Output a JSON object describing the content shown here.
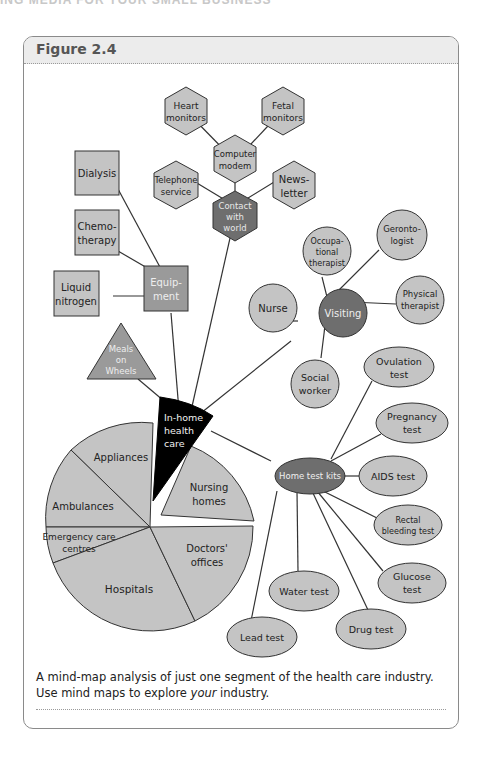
{
  "page": {
    "running_head": "ING MEDIA FOR YOUR SMALL BUSINESS"
  },
  "figure": {
    "title": "Figure 2.4",
    "caption_part1": "A mind-map analysis of just one segment of the health care industry. Use mind maps to explore ",
    "caption_emphasis": "your",
    "caption_part2": " industry."
  },
  "colors": {
    "light_fill": "#c4c4c4",
    "dark_fill": "#6e6e6e",
    "center_fill": "#000000",
    "stroke": "#333333"
  },
  "mindmap": {
    "center": {
      "line1": "In-home",
      "line2": "health",
      "line3": "care"
    },
    "contact": {
      "hub": {
        "line1": "Contact",
        "line2": "with",
        "line3": "world"
      },
      "computer": {
        "line1": "Computer",
        "line2": "modem"
      },
      "heart": {
        "line1": "Heart",
        "line2": "monitors"
      },
      "fetal": {
        "line1": "Fetal",
        "line2": "monitors"
      },
      "telephone": {
        "line1": "Telephone",
        "line2": "service"
      },
      "newsletter": {
        "line1": "News-",
        "line2": "letter"
      }
    },
    "equipment": {
      "hub": {
        "line1": "Equip-",
        "line2": "ment"
      },
      "dialysis": {
        "line1": "Dialysis"
      },
      "chemo": {
        "line1": "Chemo-",
        "line2": "therapy"
      },
      "nitrogen": {
        "line1": "Liquid",
        "line2": "nitrogen"
      }
    },
    "meals": {
      "line1": "Meals",
      "line2": "on",
      "line3": "Wheels"
    },
    "visiting": {
      "hub": {
        "line1": "Visiting"
      },
      "nurse": {
        "line1": "Nurse"
      },
      "occupational": {
        "line1": "Occupa-",
        "line2": "tional",
        "line3": "therapist"
      },
      "gerontologist": {
        "line1": "Geronto-",
        "line2": "logist"
      },
      "physical": {
        "line1": "Physical",
        "line2": "therapist"
      },
      "social": {
        "line1": "Social",
        "line2": "worker"
      }
    },
    "test_kits": {
      "hub": {
        "line1": "Home test kits"
      },
      "ovulation": {
        "line1": "Ovulation",
        "line2": "test"
      },
      "pregnancy": {
        "line1": "Pregnancy",
        "line2": "test"
      },
      "aids": {
        "line1": "AIDS test"
      },
      "rectal": {
        "line1": "Rectal",
        "line2": "bleeding test"
      },
      "glucose": {
        "line1": "Glucose",
        "line2": "test"
      },
      "drug": {
        "line1": "Drug test"
      },
      "water": {
        "line1": "Water test"
      },
      "lead": {
        "line1": "Lead test"
      }
    },
    "pie": {
      "appliances": {
        "line1": "Appliances"
      },
      "ambulances": {
        "line1": "Ambulances"
      },
      "emergency": {
        "line1": "Emergency care",
        "line2": "centres"
      },
      "hospitals": {
        "line1": "Hospitals"
      },
      "doctors": {
        "line1": "Doctors'",
        "line2": "offices"
      },
      "nursing": {
        "line1": "Nursing",
        "line2": "homes"
      }
    }
  }
}
